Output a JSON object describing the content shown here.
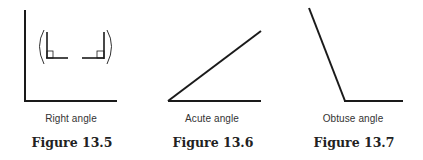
{
  "figures": [
    {
      "id": "13.5",
      "label": "Figure 13.5",
      "caption": "Right angle",
      "type": "right-angle",
      "has_right_angle_markers": true
    },
    {
      "id": "13.6",
      "label": "Figure 13.6",
      "caption": "Acute angle",
      "type": "acute-angle"
    },
    {
      "id": "13.7",
      "label": "Figure 13.7",
      "caption": "Obtuse angle",
      "type": "obtuse-angle"
    }
  ],
  "colors": {
    "line": "#1a1a1a",
    "background": "#ffffff"
  }
}
